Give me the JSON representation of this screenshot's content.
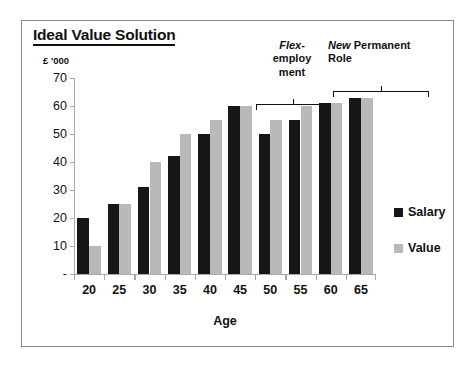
{
  "chart_data": {
    "type": "bar",
    "title": "Ideal Value Solution",
    "xlabel": "Age",
    "ylabel": "£ '000",
    "categories": [
      "20",
      "25",
      "30",
      "35",
      "40",
      "45",
      "50",
      "55",
      "60",
      "65"
    ],
    "series": [
      {
        "name": "Salary",
        "color": "#161616",
        "values": [
          20,
          25,
          31,
          42,
          50,
          60,
          50,
          55,
          61,
          63
        ]
      },
      {
        "name": "Value",
        "color": "#b9b9b9",
        "values": [
          10,
          25,
          40,
          50,
          55,
          60,
          55,
          60,
          61,
          63
        ]
      }
    ],
    "ylim": [
      0,
      70
    ],
    "yticks": [
      0,
      10,
      20,
      30,
      40,
      50,
      60,
      70
    ],
    "ytick_labels": [
      "-",
      "10",
      "20",
      "30",
      "40",
      "50",
      "60",
      "70"
    ],
    "grid": false,
    "legend_position": "right",
    "annotations": [
      {
        "id": "flex-employment",
        "lines": [
          {
            "text": "Flex-",
            "style": "italic"
          },
          {
            "text": "employ",
            "style": "normal"
          },
          {
            "text": "ment",
            "style": "normal"
          }
        ],
        "bracket_spans_categories": [
          "50",
          "55"
        ]
      },
      {
        "id": "new-permanent-role",
        "lines": [
          {
            "text": "New ",
            "style": "italic",
            "text2": "Permanent"
          },
          {
            "text": "Role",
            "style": "normal"
          }
        ],
        "bracket_spans_categories": [
          "60",
          "65"
        ]
      }
    ]
  },
  "legend": {
    "items": [
      {
        "label": "Salary",
        "color": "#161616"
      },
      {
        "label": "Value",
        "color": "#b9b9b9"
      }
    ]
  },
  "annotation_text": {
    "flex_line1": "Flex-",
    "flex_line2": "employ",
    "flex_line3": "ment",
    "new_italic": "New",
    "new_rest": " Permanent",
    "new_line2": "Role"
  }
}
